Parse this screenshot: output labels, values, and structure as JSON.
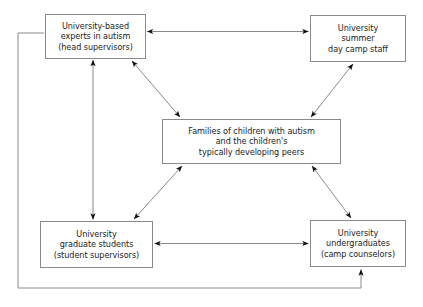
{
  "diagram": {
    "line_color": "#8a8a8a",
    "arrow_color": "#111111",
    "box_border_color": "#8a8a8a",
    "background_color": "#ffffff",
    "text_color": "#1b1b1b",
    "nodes": [
      {
        "id": "experts",
        "label": "University-based\nexperts in autism\n(head supervisors)",
        "lines": [
          "University-based",
          "experts in autism",
          "(head supervisors)"
        ],
        "position": "top-left"
      },
      {
        "id": "camp_staff",
        "label": "University\nsummer\nday camp staff",
        "lines": [
          "University",
          "summer",
          "day camp staff"
        ],
        "position": "top-right"
      },
      {
        "id": "families",
        "label": "Families of children with autism\nand the children's\ntypically developing peers",
        "lines": [
          "Families of children with autism",
          "and the children's",
          "typically developing peers"
        ],
        "position": "center"
      },
      {
        "id": "grad_students",
        "label": "University\ngraduate students\n(student supervisors)",
        "lines": [
          "University",
          "graduate students",
          "(student supervisors)"
        ],
        "position": "bottom-left"
      },
      {
        "id": "undergraduates",
        "label": "University\nundergraduates\n(camp counselors)",
        "lines": [
          "University",
          "undergraduates",
          "(camp counselors)"
        ],
        "position": "bottom-right"
      }
    ],
    "edges": [
      {
        "id": "experts-camp_staff",
        "from": "experts",
        "to": "camp_staff",
        "style": "double-arrow",
        "orientation": "horizontal"
      },
      {
        "id": "experts-grad_students",
        "from": "experts",
        "to": "grad_students",
        "style": "double-arrow",
        "orientation": "vertical"
      },
      {
        "id": "experts-families",
        "from": "experts",
        "to": "families",
        "style": "double-arrow",
        "orientation": "diagonal"
      },
      {
        "id": "camp_staff-families",
        "from": "camp_staff",
        "to": "families",
        "style": "double-arrow",
        "orientation": "diagonal"
      },
      {
        "id": "grad_students-families",
        "from": "grad_students",
        "to": "families",
        "style": "double-arrow",
        "orientation": "diagonal"
      },
      {
        "id": "undergraduates-families",
        "from": "undergraduates",
        "to": "families",
        "style": "double-arrow",
        "orientation": "diagonal"
      },
      {
        "id": "grad_students-undergraduates",
        "from": "grad_students",
        "to": "undergraduates",
        "style": "double-arrow",
        "orientation": "horizontal"
      },
      {
        "id": "experts-undergraduates-loop",
        "from": "experts",
        "to": "undergraduates",
        "style": "single-arrow",
        "orientation": "orthogonal-loop"
      }
    ]
  }
}
